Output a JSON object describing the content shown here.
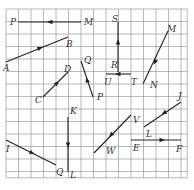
{
  "figure": {
    "grid": {
      "x0": 6,
      "y0": 9,
      "cell": 12.5,
      "cols": 14.5,
      "rows": 13.5,
      "line_color": "#9a9a9a"
    },
    "vector_color": "#222222",
    "vectors": [
      {
        "id": "MP",
        "from": [
          81,
          22
        ],
        "to": [
          18,
          22
        ],
        "arrow_at": [
          50,
          22
        ],
        "labels": [
          {
            "text": "P",
            "x": 10,
            "y": 25
          },
          {
            "text": "M",
            "x": 84,
            "y": 25
          }
        ]
      },
      {
        "id": "AB",
        "from": [
          6,
          62
        ],
        "to": [
          68,
          37
        ],
        "arrow_at": [
          40,
          48
        ],
        "labels": [
          {
            "text": "A",
            "x": 3,
            "y": 71
          },
          {
            "text": "B",
            "x": 66,
            "y": 47
          }
        ]
      },
      {
        "id": "CD",
        "from": [
          43,
          97
        ],
        "to": [
          68,
          72
        ],
        "arrow_at": [
          57,
          83
        ],
        "labels": [
          {
            "text": "C",
            "x": 35,
            "y": 103
          },
          {
            "text": "D",
            "x": 64,
            "y": 72
          }
        ]
      },
      {
        "id": "PQ",
        "from": [
          93,
          97
        ],
        "to": [
          81,
          61
        ],
        "arrow_at": [
          87,
          80
        ],
        "labels": [
          {
            "text": "Q",
            "x": 84,
            "y": 63
          },
          {
            "text": "P",
            "x": 97,
            "y": 100
          }
        ]
      },
      {
        "id": "RS",
        "from": [
          118,
          72
        ],
        "to": [
          118,
          22
        ],
        "arrow_at": [
          118,
          42
        ],
        "labels": [
          {
            "text": "S",
            "x": 112,
            "y": 22
          },
          {
            "text": "R",
            "x": 111,
            "y": 68
          }
        ]
      },
      {
        "id": "TU",
        "from": [
          131,
          74
        ],
        "to": [
          106,
          74
        ],
        "arrow_at": [
          118,
          74
        ],
        "labels": [
          {
            "text": "U",
            "x": 104,
            "y": 85
          },
          {
            "text": "T",
            "x": 131,
            "y": 85
          }
        ]
      },
      {
        "id": "MN",
        "from": [
          168,
          31
        ],
        "to": [
          143,
          84
        ],
        "arrow_at": [
          155,
          62
        ],
        "labels": [
          {
            "text": "M",
            "x": 167,
            "y": 32
          },
          {
            "text": "N",
            "x": 150,
            "y": 88
          }
        ]
      },
      {
        "id": "KL",
        "from": [
          68,
          117
        ],
        "to": [
          68,
          172
        ],
        "arrow_at": [
          68,
          145
        ],
        "labels": [
          {
            "text": "K",
            "x": 70,
            "y": 114
          },
          {
            "text": "L",
            "x": 70,
            "y": 178
          }
        ]
      },
      {
        "id": "IQ",
        "from": [
          6,
          140
        ],
        "to": [
          56,
          165
        ],
        "arrow_at": [
          32,
          153
        ],
        "labels": [
          {
            "text": "I",
            "x": 6,
            "y": 152
          },
          {
            "text": "Q",
            "x": 56,
            "y": 175
          }
        ]
      },
      {
        "id": "VW",
        "from": [
          131,
          115
        ],
        "to": [
          94,
          153
        ],
        "arrow_at": [
          111,
          135
        ],
        "labels": [
          {
            "text": "V",
            "x": 133,
            "y": 123
          },
          {
            "text": "W",
            "x": 106,
            "y": 154
          }
        ]
      },
      {
        "id": "JL",
        "from": [
          181,
          102
        ],
        "to": [
          144,
          127
        ],
        "arrow_at": [
          164,
          113
        ],
        "labels": [
          {
            "text": "J",
            "x": 178,
            "y": 99
          },
          {
            "text": "L",
            "x": 146,
            "y": 137
          }
        ]
      },
      {
        "id": "EF",
        "from": [
          131,
          140
        ],
        "to": [
          181,
          140
        ],
        "arrow_at": [
          162,
          140
        ],
        "labels": [
          {
            "text": "E",
            "x": 133,
            "y": 151
          },
          {
            "text": "F",
            "x": 176,
            "y": 152
          }
        ]
      }
    ]
  }
}
